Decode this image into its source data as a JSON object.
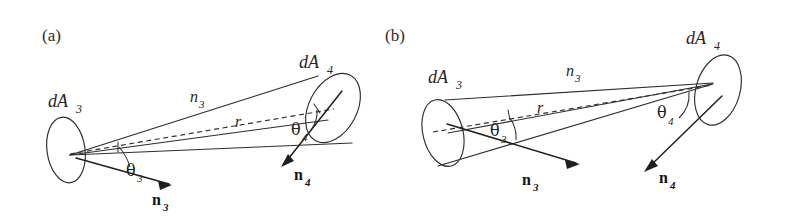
{
  "figure": {
    "background_color": "#ffffff",
    "ink_color": "#2e2e2e",
    "width": 794,
    "height": 217
  },
  "panels": [
    {
      "tag": "(a)",
      "description": "Cone apex at dA3, widening toward dA4",
      "labels": {
        "area_near": "dA",
        "area_near_sub": "3",
        "area_far": "dA",
        "area_far_sub": "4",
        "edge": "n",
        "edge_sub": "3",
        "distance": "r",
        "angle_near": "θ",
        "angle_near_sub": "3",
        "angle_far": "θ",
        "angle_far_sub": "4",
        "normal_near": "n",
        "normal_near_sub": "3",
        "normal_far": "n",
        "normal_far_sub": "4"
      }
    },
    {
      "tag": "(b)",
      "description": "Cone apex at dA4, widening toward dA3",
      "labels": {
        "area_near": "dA",
        "area_near_sub": "3",
        "area_far": "dA",
        "area_far_sub": "4",
        "edge": "n",
        "edge_sub": "3",
        "distance": "r",
        "angle_near": "θ",
        "angle_near_sub": "3",
        "angle_far": "θ",
        "angle_far_sub": "4",
        "normal_near": "n",
        "normal_near_sub": "3",
        "normal_far": "n",
        "normal_far_sub": "4"
      }
    }
  ]
}
